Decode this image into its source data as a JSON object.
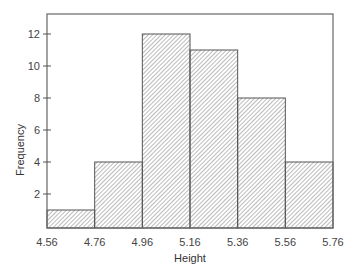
{
  "chart_data": {
    "type": "bar",
    "title": "",
    "xlabel": "Height",
    "ylabel": "Frequency",
    "bin_edges": [
      4.56,
      4.76,
      4.96,
      5.16,
      5.36,
      5.56,
      5.76
    ],
    "categories": [
      "4.56-4.76",
      "4.76-4.96",
      "4.96-5.16",
      "5.16-5.36",
      "5.36-5.56",
      "5.56-5.76"
    ],
    "values": [
      1,
      4,
      12,
      11,
      8,
      4
    ],
    "xticks": [
      "4.56",
      "4.76",
      "4.96",
      "5.16",
      "5.36",
      "5.56",
      "5.76"
    ],
    "yticks": [
      "2",
      "4",
      "6",
      "8",
      "10",
      "12"
    ],
    "xlim": [
      4.56,
      5.76
    ],
    "ylim": [
      0,
      13.2
    ],
    "grid": false,
    "legend": null,
    "fill": "diagonal-hatch",
    "colors": {
      "stroke": "#555555",
      "hatch": "#777777",
      "background": "#ffffff"
    }
  }
}
